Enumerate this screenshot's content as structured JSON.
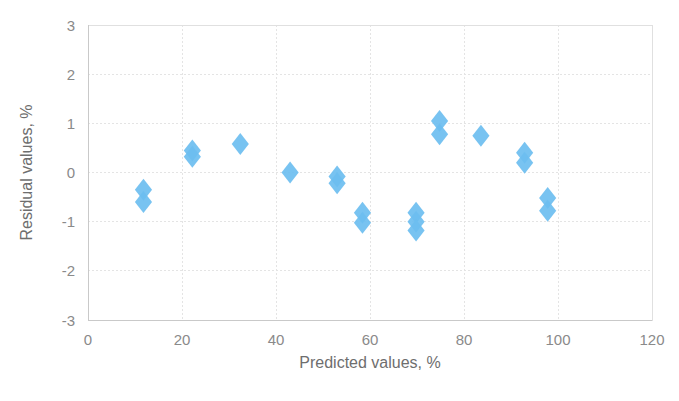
{
  "chart_data": {
    "type": "scatter",
    "title": "",
    "subtitle": "",
    "xlabel": "Predicted values, %",
    "ylabel": "Residual values, %",
    "xlim": [
      0,
      120
    ],
    "ylim": [
      -3,
      3
    ],
    "x_ticks": [
      0,
      20,
      40,
      60,
      80,
      100,
      120
    ],
    "y_ticks": [
      3,
      2,
      1,
      0,
      -1,
      -2,
      -3
    ],
    "x_tick_labels": [
      "0",
      "20",
      "40",
      "60",
      "80",
      "100",
      "120"
    ],
    "y_tick_labels": [
      "3",
      "2",
      "1",
      "0",
      "-1",
      "-2",
      "-3"
    ],
    "grid": "horizontal-and-vertical-dotted",
    "legend": "none",
    "legend_position": "none",
    "marker_shape": "diamond",
    "marker_color": "#6CBEF0",
    "marker_size": 11,
    "series": [
      {
        "name": "Residuals",
        "points": [
          {
            "x": 11.8,
            "y": -0.35
          },
          {
            "x": 11.8,
            "y": -0.6
          },
          {
            "x": 22.2,
            "y": 0.45
          },
          {
            "x": 22.2,
            "y": 0.32
          },
          {
            "x": 32.4,
            "y": 0.58
          },
          {
            "x": 43.0,
            "y": 0.0
          },
          {
            "x": 53.0,
            "y": -0.08
          },
          {
            "x": 53.0,
            "y": -0.22
          },
          {
            "x": 58.4,
            "y": -0.82
          },
          {
            "x": 58.4,
            "y": -1.02
          },
          {
            "x": 69.8,
            "y": -0.82
          },
          {
            "x": 69.8,
            "y": -1.0
          },
          {
            "x": 69.8,
            "y": -1.18
          },
          {
            "x": 74.8,
            "y": 1.05
          },
          {
            "x": 74.8,
            "y": 0.78
          },
          {
            "x": 83.6,
            "y": 0.75
          },
          {
            "x": 92.9,
            "y": 0.4
          },
          {
            "x": 92.9,
            "y": 0.2
          },
          {
            "x": 97.8,
            "y": -0.52
          },
          {
            "x": 97.8,
            "y": -0.78
          }
        ]
      }
    ]
  },
  "axes": {
    "x_title": "Predicted values, %",
    "y_title": "Residual values, %"
  },
  "colors": {
    "marker": "#6CBEF0",
    "grid": "#e4e4e4",
    "axis": "#c9c9c9",
    "tick_text": "#8a8a8a",
    "title_text": "#6e6e6e",
    "background": "#ffffff"
  }
}
